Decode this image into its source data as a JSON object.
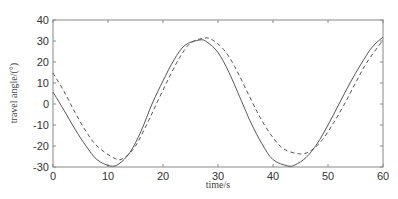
{
  "chart_data": {
    "type": "line",
    "title": "",
    "xlabel": "time/s",
    "ylabel": "travel angle/(°)",
    "xlim": [
      0,
      60
    ],
    "ylim": [
      -30,
      40
    ],
    "x_ticks": [
      0,
      10,
      20,
      30,
      40,
      50,
      60
    ],
    "y_ticks": [
      -30,
      -20,
      -10,
      0,
      10,
      20,
      30,
      40
    ],
    "x_tick_labels": [
      "0",
      "10",
      "20",
      "30",
      "40",
      "50",
      "60"
    ],
    "y_tick_labels": [
      "-30",
      "-20",
      "-10",
      "0",
      "10",
      "20",
      "30",
      "40"
    ],
    "grid": false,
    "legend": null,
    "series": [
      {
        "name": "solid",
        "style": "solid",
        "color": "#555555",
        "x": [
          0,
          2,
          4,
          6,
          8,
          10.4,
          12,
          14,
          16,
          18,
          20,
          22,
          24,
          26.7,
          28,
          30,
          32,
          34.5,
          36,
          38,
          40,
          42.7,
          44,
          46,
          48,
          50,
          52,
          54,
          56,
          58,
          60
        ],
        "y": [
          5.7,
          -3,
          -12,
          -20,
          -26.5,
          -29.5,
          -28.5,
          -23,
          -13,
          0,
          11,
          21,
          28,
          30.5,
          29.5,
          24.5,
          15,
          0,
          -9,
          -19,
          -26.5,
          -29.5,
          -29,
          -25.5,
          -19,
          -10,
          0,
          10,
          19,
          27,
          31.9
        ]
      },
      {
        "name": "dashed",
        "style": "dashed",
        "color": "#555555",
        "x": [
          0,
          2,
          4,
          6,
          8,
          11.3,
          13,
          15,
          17,
          18.8,
          21,
          23,
          25,
          27.5,
          29,
          31,
          33,
          36.4,
          38,
          40,
          42,
          45,
          47,
          49,
          51,
          53,
          55,
          57,
          60
        ],
        "y": [
          14.8,
          6,
          -4,
          -13,
          -20,
          -26,
          -25.5,
          -20,
          -10,
          0,
          12,
          22,
          29,
          31.4,
          30.5,
          26,
          18,
          0,
          -8,
          -16,
          -21.5,
          -23.8,
          -22,
          -17,
          -9,
          0,
          10,
          19.5,
          30.5
        ]
      }
    ]
  }
}
